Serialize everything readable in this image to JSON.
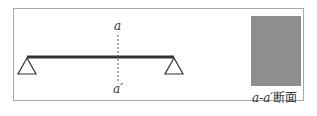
{
  "diagram": {
    "type": "simply-supported-beam",
    "beam": {
      "x1": 27,
      "x2": 174,
      "y": 57,
      "color": "#333333",
      "thickness": 3
    },
    "supports": [
      {
        "name": "left-pin-support",
        "x": 27
      },
      {
        "name": "right-pin-support",
        "x": 174
      }
    ],
    "cut_line": {
      "x": 118,
      "top_label": "a",
      "bottom_label": "a′"
    },
    "section": {
      "fill_color": "#8e8e8e",
      "label_prefix": "a-a′",
      "label_suffix": "断面"
    },
    "frame_border_color": "#a8a8a8"
  }
}
